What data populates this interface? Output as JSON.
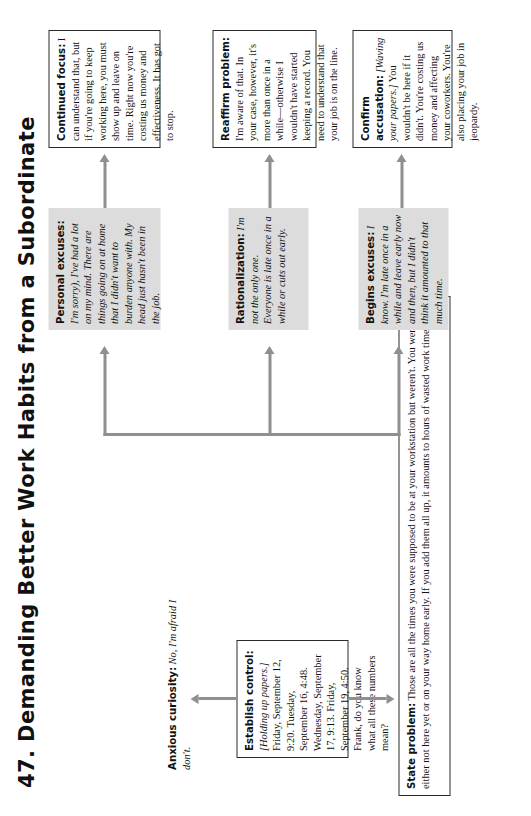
{
  "page": {
    "title": "47. Demanding Better Work Habits from a Subordinate",
    "orientation": "landscape-rotated-90ccw",
    "accent_line_color": "#8f8f8f",
    "shaded_box_color": "#dcdcdc",
    "box_border_color": "#2b2b2b"
  },
  "nodes": {
    "establish_control": {
      "label": "Establish control:",
      "stage": "[Holding up papers.]",
      "text": " Friday, September 12, 9:20. Tuesday, September 16, 4:48. Wednesday, September 17, 9:13. Friday, September 19, 4:50. Frank, do you know what all these numbers mean?",
      "style": "boxed"
    },
    "anxious_curiosity": {
      "label": "Anxious curiosity:",
      "response": "No, I'm afraid I don't.",
      "style": "plain"
    },
    "state_problem": {
      "label": "State problem:",
      "text": " Those are all the times you were supposed to be at your workstation but weren't. You were either not here yet or on your way home early. If you add them all up, it amounts to hours of wasted work time.",
      "style": "boxed"
    },
    "personal_excuses": {
      "label": "Personal excuses:",
      "response": "I'm sorry), I've had a lot on my mind. There are things going on at home that I didn't want to burden anyone with. My head just hasn't been in the job.",
      "style": "shaded"
    },
    "rationalization": {
      "label": "Rationalization:",
      "response": "I'm not the only one. Everyone is late once in a while or cuts out early.",
      "style": "shaded"
    },
    "begins_excuses": {
      "label": "Begins excuses:",
      "response": "I know. I'm late once in a while and leave early now and then, but I didn't think it amounted to that much time.",
      "style": "shaded"
    },
    "continued_focus": {
      "label": "Continued focus:",
      "text": " I can understand that, but if you're going to keep working here, you must show up and leave on time. Right now you're costing us money and effectiveness. It has got to stop.",
      "style": "boxed"
    },
    "reaffirm_problem": {
      "label": "Reaffirm problem:",
      "text": " I'm aware of that. In your case, however, it's more than once in a while—otherwise I wouldn't have started keeping a record. You need to understand that your job is on the line.",
      "style": "boxed"
    },
    "confirm_accusation": {
      "label": "Confirm accusation:",
      "stage": "[Waving your papers.]",
      "text": " You wouldn't be here if it didn't. You're costing us money and affecting your coworkers. You're also placing your job in jeopardy.",
      "style": "boxed"
    }
  },
  "connectors": [
    {
      "name": "establish-control-to-anxious-curiosity",
      "direction": "right"
    },
    {
      "name": "establish-control-to-state-problem",
      "direction": "down"
    },
    {
      "name": "state-problem-to-personal-excuses",
      "direction": "right"
    },
    {
      "name": "state-problem-to-rationalization",
      "direction": "right"
    },
    {
      "name": "state-problem-to-begins-excuses",
      "direction": "right"
    },
    {
      "name": "personal-excuses-to-continued-focus",
      "direction": "right"
    },
    {
      "name": "rationalization-to-reaffirm-problem",
      "direction": "right"
    },
    {
      "name": "begins-excuses-to-confirm-accusation",
      "direction": "right"
    }
  ]
}
